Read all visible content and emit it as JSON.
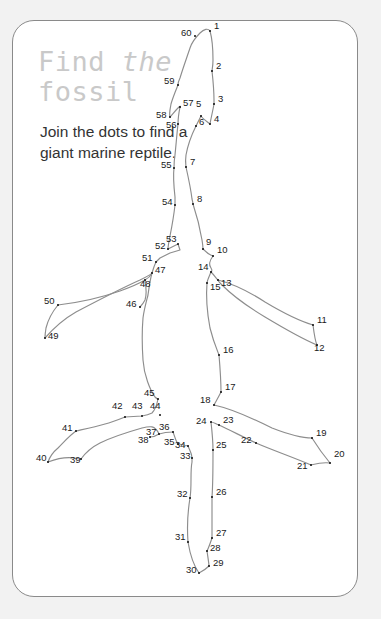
{
  "card": {
    "background_color": "#ffffff",
    "border_color": "#8a8a8a",
    "page_background_color": "#f2f2f2"
  },
  "title": {
    "line1_a": "Find",
    "line1_b": "the",
    "line2": "fossil",
    "color": "#c9c9c9"
  },
  "instruction": {
    "text": "Join the dots to find a giant marine reptile.",
    "color": "#333333"
  },
  "puzzle": {
    "type": "connect-the-dots",
    "dot_count": 60,
    "dot_color": "#111111",
    "outline_color": "#8d8d8d",
    "dots": [
      {
        "n": "1",
        "x": 210,
        "y": 31,
        "lx": 214,
        "ly": 26
      },
      {
        "n": "2",
        "x": 212,
        "y": 71,
        "lx": 216,
        "ly": 66
      },
      {
        "n": "3",
        "x": 214,
        "y": 104,
        "lx": 218,
        "ly": 99
      },
      {
        "n": "4",
        "x": 210,
        "y": 124,
        "lx": 214,
        "ly": 119
      },
      {
        "n": "5",
        "x": 201,
        "y": 116,
        "lx": 196,
        "ly": 104
      },
      {
        "n": "6",
        "x": 196,
        "y": 126,
        "lx": 199,
        "ly": 122
      },
      {
        "n": "7",
        "x": 186,
        "y": 167,
        "lx": 190,
        "ly": 162
      },
      {
        "n": "8",
        "x": 193,
        "y": 204,
        "lx": 197,
        "ly": 199
      },
      {
        "n": "9",
        "x": 203,
        "y": 249,
        "lx": 206,
        "ly": 242
      },
      {
        "n": "10",
        "x": 213,
        "y": 256,
        "lx": 217,
        "ly": 250
      },
      {
        "n": "11",
        "x": 313,
        "y": 325,
        "lx": 317,
        "ly": 320
      },
      {
        "n": "12",
        "x": 317,
        "y": 345,
        "lx": 314,
        "ly": 348
      },
      {
        "n": "13",
        "x": 218,
        "y": 280,
        "lx": 221,
        "ly": 283
      },
      {
        "n": "14",
        "x": 211,
        "y": 272,
        "lx": 198,
        "ly": 267
      },
      {
        "n": "15",
        "x": 207,
        "y": 283,
        "lx": 210,
        "ly": 287
      },
      {
        "n": "16",
        "x": 219,
        "y": 355,
        "lx": 223,
        "ly": 350
      },
      {
        "n": "17",
        "x": 221,
        "y": 392,
        "lx": 225,
        "ly": 387
      },
      {
        "n": "18",
        "x": 214,
        "y": 405,
        "lx": 200,
        "ly": 400
      },
      {
        "n": "19",
        "x": 312,
        "y": 438,
        "lx": 316,
        "ly": 433
      },
      {
        "n": "20",
        "x": 330,
        "y": 463,
        "lx": 334,
        "ly": 454
      },
      {
        "n": "21",
        "x": 311,
        "y": 465,
        "lx": 297,
        "ly": 466
      },
      {
        "n": "22",
        "x": 256,
        "y": 443,
        "lx": 241,
        "ly": 440
      },
      {
        "n": "23",
        "x": 219,
        "y": 425,
        "lx": 223,
        "ly": 420
      },
      {
        "n": "24",
        "x": 211,
        "y": 422,
        "lx": 196,
        "ly": 421
      },
      {
        "n": "25",
        "x": 213,
        "y": 450,
        "lx": 216,
        "ly": 445
      },
      {
        "n": "26",
        "x": 212,
        "y": 497,
        "lx": 216,
        "ly": 492
      },
      {
        "n": "27",
        "x": 212,
        "y": 538,
        "lx": 216,
        "ly": 533
      },
      {
        "n": "28",
        "x": 207,
        "y": 551,
        "lx": 210,
        "ly": 548
      },
      {
        "n": "29",
        "x": 209,
        "y": 566,
        "lx": 213,
        "ly": 563
      },
      {
        "n": "30",
        "x": 199,
        "y": 573,
        "lx": 186,
        "ly": 570
      },
      {
        "n": "31",
        "x": 188,
        "y": 542,
        "lx": 175,
        "ly": 537
      },
      {
        "n": "32",
        "x": 190,
        "y": 498,
        "lx": 177,
        "ly": 494
      },
      {
        "n": "33",
        "x": 192,
        "y": 458,
        "lx": 180,
        "ly": 456
      },
      {
        "n": "34",
        "x": 188,
        "y": 446,
        "lx": 175,
        "ly": 445
      },
      {
        "n": "35",
        "x": 178,
        "y": 444,
        "lx": 164,
        "ly": 442
      },
      {
        "n": "36",
        "x": 173,
        "y": 432,
        "lx": 159,
        "ly": 427
      },
      {
        "n": "37",
        "x": 159,
        "y": 434,
        "lx": 146,
        "ly": 432
      },
      {
        "n": "38",
        "x": 150,
        "y": 437,
        "lx": 138,
        "ly": 440
      },
      {
        "n": "39",
        "x": 81,
        "y": 459,
        "lx": 70,
        "ly": 460
      },
      {
        "n": "40",
        "x": 48,
        "y": 462,
        "lx": 36,
        "ly": 458
      },
      {
        "n": "41",
        "x": 76,
        "y": 431,
        "lx": 62,
        "ly": 428
      },
      {
        "n": "42",
        "x": 125,
        "y": 417,
        "lx": 112,
        "ly": 406
      },
      {
        "n": "43",
        "x": 142,
        "y": 416,
        "lx": 132,
        "ly": 406
      },
      {
        "n": "44",
        "x": 160,
        "y": 415,
        "lx": 150,
        "ly": 406
      },
      {
        "n": "45",
        "x": 158,
        "y": 399,
        "lx": 144,
        "ly": 393
      },
      {
        "n": "46",
        "x": 140,
        "y": 307,
        "lx": 126,
        "ly": 304
      },
      {
        "n": "47",
        "x": 152,
        "y": 273,
        "lx": 155,
        "ly": 270
      },
      {
        "n": "48",
        "x": 145,
        "y": 280,
        "lx": 140,
        "ly": 284
      },
      {
        "n": "49",
        "x": 45,
        "y": 338,
        "lx": 48,
        "ly": 336
      },
      {
        "n": "50",
        "x": 58,
        "y": 305,
        "lx": 44,
        "ly": 301
      },
      {
        "n": "51",
        "x": 156,
        "y": 262,
        "lx": 142,
        "ly": 258
      },
      {
        "n": "52",
        "x": 168,
        "y": 249,
        "lx": 155,
        "ly": 246
      },
      {
        "n": "53",
        "x": 178,
        "y": 244,
        "lx": 166,
        "ly": 239
      },
      {
        "n": "54",
        "x": 175,
        "y": 205,
        "lx": 162,
        "ly": 202
      },
      {
        "n": "55",
        "x": 174,
        "y": 168,
        "lx": 161,
        "ly": 165
      },
      {
        "n": "56",
        "x": 178,
        "y": 124,
        "lx": 166,
        "ly": 125
      },
      {
        "n": "57",
        "x": 180,
        "y": 107,
        "lx": 183,
        "ly": 103
      },
      {
        "n": "58",
        "x": 170,
        "y": 117,
        "lx": 156,
        "ly": 115
      },
      {
        "n": "59",
        "x": 178,
        "y": 85,
        "lx": 164,
        "ly": 81
      },
      {
        "n": "60",
        "x": 195,
        "y": 36,
        "lx": 181,
        "ly": 33
      }
    ],
    "paths": [
      "M 210 31 C 208 28 204 29 200 33 C 196 37 192 42 190 48 C 187 57 183 68 180 78 C 178 82 178 84 178 85",
      "M 178 85 C 176 90 173 97 171 104 C 170 110 169 113 170 117",
      "M 170 117 C 172 115 175 111 178 108 C 180 106 181 106 180 107",
      "M 180 107 C 179 112 178 118 178 124",
      "M 178 124 C 177 133 176 145 175 155 C 174 161 174 165 174 168",
      "M 174 168 C 173 176 174 188 175 197 C 175 202 175 204 175 205",
      "M 175 205 C 174 214 172 226 170 236 C 169 241 168 246 168 249",
      "M 168 249 L 178 244 L 180 250 L 170 253 L 160 258 L 156 262",
      "M 156 262 C 154 266 153 270 152 273",
      "M 152 273 C 150 277 147 279 145 280",
      "M 145 280 C 146 286 147 294 145 300 C 143 304 141 306 140 307",
      "M 152 273 C 150 280 149 288 148 295 C 146 303 144 310 143 318 C 142 330 142 345 143 360 C 144 375 150 390 155 397 C 157 399 158 399 158 399",
      "M 158 399 C 157 404 155 410 152 413 C 148 415 142 416 142 416 L 125 417",
      "M 125 417 C 120 419 113 422 105 424 C 95 427 85 429 76 431",
      "M 76 431 C 70 435 64 442 58 448 C 52 453 49 459 48 462",
      "M 48 462 C 56 459 66 457 74 458 C 79 459 81 459 81 459",
      "M 81 459 C 86 452 92 447 100 443 C 112 437 128 432 142 428 C 150 426 155 425 159 434",
      "M 159 434 C 156 436 152 437 150 437",
      "M 145 280 C 140 283 131 287 120 291 C 100 298 75 303 58 305",
      "M 58 305 C 53 311 48 320 46 328 C 45 334 45 337 45 338",
      "M 45 338 C 52 330 62 320 76 312 C 95 302 120 289 140 280 C 148 276 152 274 152 273",
      "M 210 31 C 212 38 213 50 213 60 C 213 66 212 70 212 71",
      "M 212 71 C 213 80 214 92 214 100 C 214 103 214 104 214 104",
      "M 214 104 C 213 110 211 118 210 124",
      "M 210 124 C 206 121 202 118 201 116",
      "M 201 116 C 199 120 197 124 196 126",
      "M 196 126 C 192 134 188 144 186 155 C 185 162 186 166 186 167",
      "M 186 167 C 188 176 191 190 192 199 C 193 203 193 204 193 204",
      "M 193 204 C 196 213 200 228 202 240 C 203 246 203 249 203 249",
      "M 203 249 C 206 252 210 255 213 256",
      "M 213 256 C 210 260 208 264 211 268 C 213 271 211 272 211 272",
      "M 211 272 C 209 277 207 281 207 283",
      "M 211 272 C 214 275 216 278 218 280",
      "M 218 280 C 230 283 248 291 265 302 C 285 314 303 322 313 325",
      "M 313 325 C 314 333 315 341 317 345",
      "M 317 345 C 305 340 285 329 265 317 C 245 305 230 293 222 285 C 219 282 218 281 218 280",
      "M 207 283 C 206 295 207 312 210 328 C 214 344 218 352 219 355",
      "M 219 355 C 220 367 221 382 221 392",
      "M 221 392 C 218 398 215 403 214 405",
      "M 214 405 C 228 408 250 417 272 428 C 295 437 308 438 312 438",
      "M 312 438 C 317 446 325 457 330 463",
      "M 330 463 C 322 462 315 464 311 465",
      "M 311 465 C 295 458 272 450 256 443",
      "M 256 443 C 243 437 230 430 219 425",
      "M 219 425 C 216 424 213 422 211 422",
      "M 211 422 C 212 431 213 442 213 450",
      "M 213 450 C 213 465 213 484 212 497",
      "M 212 497 C 212 512 212 530 212 538",
      "M 212 538 C 210 544 208 549 207 551",
      "M 207 551 C 208 558 209 564 209 566",
      "M 209 566 C 205 570 201 572 199 573",
      "M 199 573 C 194 566 190 554 188 542",
      "M 188 542 C 187 528 188 510 190 498",
      "M 190 498 C 192 486 190 472 192 462 C 192 459 192 458 192 458",
      "M 192 458 C 192 453 189 449 188 446",
      "M 188 446 C 184 445 180 444 178 444",
      "M 178 444 C 175 440 174 434 173 432",
      "M 173 432 C 168 432 162 433 159 434"
    ]
  }
}
